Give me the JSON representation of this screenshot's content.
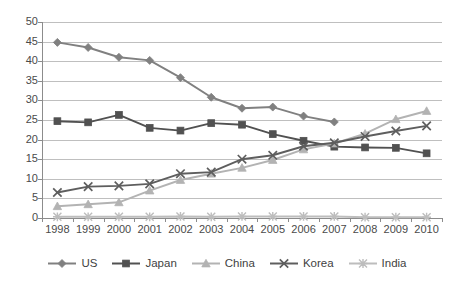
{
  "chart_data": {
    "type": "line",
    "title": "",
    "subtitle": "",
    "xlabel": "",
    "ylabel": "",
    "xlim": null,
    "ylim": [
      0,
      50
    ],
    "y_ticks": [
      0,
      5,
      10,
      15,
      20,
      25,
      30,
      35,
      40,
      45,
      50
    ],
    "grid": "horizontal",
    "legend_position": "bottom",
    "categories": [
      "1998",
      "1999",
      "2000",
      "2001",
      "2002",
      "2003",
      "2004",
      "2005",
      "2006",
      "2007",
      "2008",
      "2009",
      "2010"
    ],
    "series": [
      {
        "name": "US",
        "marker": "diamond",
        "color": "#808080",
        "values": [
          44.8,
          43.5,
          41.0,
          40.2,
          35.8,
          30.8,
          28.0,
          28.3,
          26.0,
          24.5,
          null,
          null,
          null
        ]
      },
      {
        "name": "Japan",
        "marker": "square",
        "color": "#515151",
        "values": [
          24.7,
          24.4,
          26.3,
          23.0,
          22.3,
          24.2,
          23.8,
          21.4,
          19.7,
          18.2,
          18.0,
          17.9,
          16.5
        ]
      },
      {
        "name": "China",
        "marker": "triangle",
        "color": "#b3b3b3",
        "values": [
          3.0,
          3.5,
          4.0,
          7.0,
          9.7,
          11.3,
          12.8,
          14.8,
          17.5,
          19.0,
          21.5,
          25.2,
          27.3
        ]
      },
      {
        "name": "Korea",
        "marker": "x",
        "color": "#5e5e5e",
        "values": [
          6.5,
          8.0,
          8.2,
          8.7,
          11.3,
          11.7,
          15.0,
          16.0,
          18.3,
          19.2,
          20.8,
          22.2,
          23.5
        ]
      },
      {
        "name": "India",
        "marker": "asterisk",
        "color": "#bdbdbd",
        "values": [
          0.3,
          0.3,
          0.3,
          0.3,
          0.4,
          0.3,
          0.4,
          0.4,
          0.4,
          0.4,
          0.2,
          0.2,
          0.2
        ]
      }
    ]
  },
  "axis": {
    "y_tick_labels": [
      "50",
      "45",
      "40",
      "35",
      "30",
      "25",
      "20",
      "15",
      "10",
      "5",
      "0"
    ],
    "x_tick_labels": [
      "1998",
      "1999",
      "2000",
      "2001",
      "2002",
      "2003",
      "2004",
      "2005",
      "2006",
      "2007",
      "2008",
      "2009",
      "2010"
    ]
  },
  "legend": {
    "items": [
      {
        "label": "US",
        "marker": "diamond-icon",
        "color": "#808080"
      },
      {
        "label": "Japan",
        "marker": "square-icon",
        "color": "#515151"
      },
      {
        "label": "China",
        "marker": "triangle-icon",
        "color": "#b3b3b3"
      },
      {
        "label": "Korea",
        "marker": "x-icon",
        "color": "#5e5e5e"
      },
      {
        "label": "India",
        "marker": "asterisk-icon",
        "color": "#bdbdbd"
      }
    ]
  },
  "colors": {
    "gridline": "#bfbfbf",
    "axis": "#8c8c8c",
    "text": "#4a4a4a",
    "background": "#ffffff"
  }
}
